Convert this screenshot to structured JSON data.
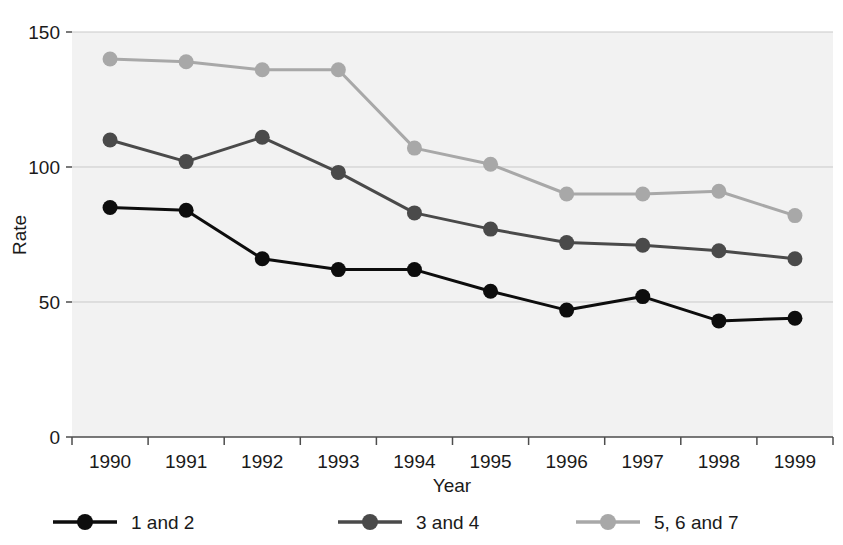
{
  "figure": {
    "background_color": "#ffffff",
    "plot_background_color": "#f2f2f2",
    "gridline_color": "#c9c9c9",
    "axis_color": "#4d4d4d",
    "partial_title": ""
  },
  "chart_data": {
    "type": "line",
    "title": "",
    "xlabel": "Year",
    "ylabel": "Rate",
    "x": [
      1990,
      1991,
      1992,
      1993,
      1994,
      1995,
      1996,
      1997,
      1998,
      1999
    ],
    "categories": [
      "1990",
      "1991",
      "1992",
      "1993",
      "1994",
      "1995",
      "1996",
      "1997",
      "1998",
      "1999"
    ],
    "xtick_labels": [
      "1990",
      "1991",
      "1992",
      "1993",
      "1994",
      "1995",
      "1996",
      "1997",
      "1998",
      "1999"
    ],
    "ytick_labels": [
      "0",
      "50",
      "100",
      "150"
    ],
    "yticks": [
      0,
      50,
      100,
      150
    ],
    "ylim": [
      0,
      150
    ],
    "grid": "horizontal",
    "legend_position": "below",
    "markers": "filled-circle",
    "series": [
      {
        "name": "1 and 2",
        "color": "#0d0d0d",
        "values": [
          85,
          84,
          66,
          62,
          62,
          54,
          47,
          52,
          43,
          44
        ]
      },
      {
        "name": "3 and 4",
        "color": "#4a4a4a",
        "values": [
          110,
          102,
          111,
          98,
          83,
          77,
          72,
          71,
          69,
          66
        ]
      },
      {
        "name": "5, 6 and 7",
        "color": "#a8a8a8",
        "values": [
          140,
          139,
          136,
          136,
          107,
          101,
          90,
          90,
          91,
          82
        ]
      }
    ]
  },
  "legend": {
    "items": [
      {
        "label": "1 and 2",
        "color": "#0d0d0d"
      },
      {
        "label": "3 and 4",
        "color": "#4a4a4a"
      },
      {
        "label": "5, 6 and 7",
        "color": "#a8a8a8"
      }
    ]
  },
  "axes": {
    "y_title": "Rate",
    "x_title": "Year"
  }
}
